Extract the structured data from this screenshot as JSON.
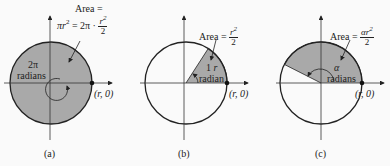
{
  "figures": [
    {
      "id": "a",
      "caption": "(a)",
      "area_title": "Area =",
      "area_formula_left": "πr",
      "area_formula_mid": "= 2π ·",
      "area_frac_num": "r",
      "area_frac_den": "2",
      "angle_value": "2π",
      "angle_unit": "radians",
      "point_label": "(r, 0)"
    },
    {
      "id": "b",
      "caption": "(b)",
      "area_title": "Area =",
      "area_frac_num": "r",
      "area_frac_den": "2",
      "arc_label": "1",
      "angle_unit": "radian",
      "point_label": "(r, 0)"
    },
    {
      "id": "c",
      "caption": "(c)",
      "area_title": "Area =",
      "area_frac_num": "αr",
      "area_frac_den": "2",
      "angle_value": "α",
      "angle_unit": "radians",
      "point_label": "(r, 0)"
    }
  ],
  "colors": {
    "shade": "#a9a9a9",
    "stroke": "#222222",
    "background": "#fafafa"
  }
}
